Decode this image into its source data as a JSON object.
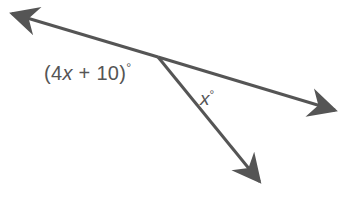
{
  "figure": {
    "width": 358,
    "height": 208,
    "background_color": "#ffffff",
    "stroke_color": "#555555",
    "text_color": "#555555",
    "stroke_width": 3
  },
  "labels": {
    "expression": {
      "open_paren": "(",
      "coefficient": "4",
      "variable": "x",
      "plus": " + ",
      "constant": "10",
      "close_paren": ")",
      "degree": "°",
      "full_text": "(4x + 10)°"
    },
    "unknown": {
      "variable": "x",
      "degree": "°",
      "full_text": "x°"
    }
  },
  "geometry": {
    "vertex": {
      "x": 158,
      "y": 57
    },
    "rays": [
      {
        "name": "ray-upper-left",
        "from": {
          "x": 158,
          "y": 57
        },
        "to": {
          "x": 4,
          "y": 11
        },
        "arrow": "true"
      },
      {
        "name": "ray-right",
        "from": {
          "x": 158,
          "y": 57
        },
        "to": {
          "x": 344,
          "y": 113
        },
        "arrow": "true"
      },
      {
        "name": "ray-lower-right",
        "from": {
          "x": 158,
          "y": 57
        },
        "to": {
          "x": 267,
          "y": 191
        },
        "arrow": "true"
      }
    ]
  }
}
